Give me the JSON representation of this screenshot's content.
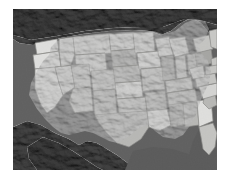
{
  "figure": {
    "kind": "map-image",
    "title": "Shaded relief map of the contiguous United States with state boundaries",
    "projection_look": "equirectangular-ish continental view",
    "style": "grayscale shaded relief, states filled light gray, surrounding land and ocean dark gray"
  },
  "canvas": {
    "width": 230,
    "height": 176,
    "background_color": "#ffffff"
  },
  "map_frame": {
    "x": 13,
    "y": 9,
    "width": 204,
    "height": 161,
    "border": "none"
  },
  "palette": {
    "page_background": "#ffffff",
    "ocean": "#5d5d5d",
    "foreign_land_dark": "#4a4a4a",
    "foreign_land_darkest": "#3a3a3a",
    "great_lakes": "#545454",
    "state_fill_lightest": "#e8e8e6",
    "state_fill_light": "#dcdcda",
    "state_fill_mid": "#cbcbc8",
    "state_fill_midtone": "#bdbdba",
    "state_fill_dark": "#a9a9a6",
    "state_border": "#8b8b88",
    "relief_shadow": "#6f6f6c",
    "relief_highlight": "#f2f2f0"
  },
  "regions": [
    {
      "name": "pacific-ocean",
      "tone": "dark",
      "label": "Pacific Ocean"
    },
    {
      "name": "atlantic-ocean",
      "tone": "dark",
      "label": "Atlantic Ocean"
    },
    {
      "name": "gulf-of-mexico",
      "tone": "dark",
      "label": "Gulf of Mexico"
    },
    {
      "name": "canada",
      "tone": "darkest",
      "label": "Canada"
    },
    {
      "name": "mexico",
      "tone": "darkest",
      "label": "Mexico"
    },
    {
      "name": "great-lakes",
      "tone": "dark",
      "label": "Great Lakes"
    }
  ],
  "states": [
    {
      "code": "WA",
      "name": "Washington",
      "tone": "lightest"
    },
    {
      "code": "OR",
      "name": "Oregon",
      "tone": "lightest"
    },
    {
      "code": "ID",
      "name": "Idaho",
      "tone": "light"
    },
    {
      "code": "MT",
      "name": "Montana",
      "tone": "light"
    },
    {
      "code": "WY",
      "name": "Wyoming",
      "tone": "light"
    },
    {
      "code": "CA",
      "name": "California",
      "tone": "lightest"
    },
    {
      "code": "NV",
      "name": "Nevada",
      "tone": "light"
    },
    {
      "code": "UT",
      "name": "Utah",
      "tone": "mid"
    },
    {
      "code": "AZ",
      "name": "Arizona",
      "tone": "mid"
    },
    {
      "code": "CO",
      "name": "Colorado",
      "tone": "mid"
    },
    {
      "code": "NM",
      "name": "New Mexico",
      "tone": "midtone"
    },
    {
      "code": "ND",
      "name": "North Dakota",
      "tone": "light"
    },
    {
      "code": "SD",
      "name": "South Dakota",
      "tone": "dark"
    },
    {
      "code": "NE",
      "name": "Nebraska",
      "tone": "midtone"
    },
    {
      "code": "KS",
      "name": "Kansas",
      "tone": "lightest"
    },
    {
      "code": "OK",
      "name": "Oklahoma",
      "tone": "mid"
    },
    {
      "code": "TX",
      "name": "Texas",
      "tone": "midtone"
    },
    {
      "code": "MN",
      "name": "Minnesota",
      "tone": "light"
    },
    {
      "code": "IA",
      "name": "Iowa",
      "tone": "lightest"
    },
    {
      "code": "MO",
      "name": "Missouri",
      "tone": "mid"
    },
    {
      "code": "AR",
      "name": "Arkansas",
      "tone": "midtone"
    },
    {
      "code": "LA",
      "name": "Louisiana",
      "tone": "lightest"
    },
    {
      "code": "WI",
      "name": "Wisconsin",
      "tone": "light"
    },
    {
      "code": "IL",
      "name": "Illinois",
      "tone": "dark"
    },
    {
      "code": "MI",
      "name": "Michigan",
      "tone": "light"
    },
    {
      "code": "IN",
      "name": "Indiana",
      "tone": "mid"
    },
    {
      "code": "OH",
      "name": "Ohio",
      "tone": "midtone"
    },
    {
      "code": "KY",
      "name": "Kentucky",
      "tone": "mid"
    },
    {
      "code": "TN",
      "name": "Tennessee",
      "tone": "midtone"
    },
    {
      "code": "MS",
      "name": "Mississippi",
      "tone": "dark"
    },
    {
      "code": "AL",
      "name": "Alabama",
      "tone": "midtone"
    },
    {
      "code": "GA",
      "name": "Georgia",
      "tone": "lightest"
    },
    {
      "code": "FL",
      "name": "Florida",
      "tone": "mid"
    },
    {
      "code": "SC",
      "name": "South Carolina",
      "tone": "midtone"
    },
    {
      "code": "NC",
      "name": "North Carolina",
      "tone": "light"
    },
    {
      "code": "VA",
      "name": "Virginia",
      "tone": "mid"
    },
    {
      "code": "WV",
      "name": "West Virginia",
      "tone": "light"
    },
    {
      "code": "PA",
      "name": "Pennsylvania",
      "tone": "dark"
    },
    {
      "code": "NY",
      "name": "New York",
      "tone": "mid"
    },
    {
      "code": "ME",
      "name": "Maine",
      "tone": "light"
    },
    {
      "code": "VT",
      "name": "Vermont",
      "tone": "mid"
    },
    {
      "code": "NH",
      "name": "New Hampshire",
      "tone": "mid"
    },
    {
      "code": "MA",
      "name": "Massachusetts",
      "tone": "light"
    },
    {
      "code": "CT",
      "name": "Connecticut",
      "tone": "mid"
    },
    {
      "code": "RI",
      "name": "Rhode Island",
      "tone": "mid"
    },
    {
      "code": "NJ",
      "name": "New Jersey",
      "tone": "mid"
    },
    {
      "code": "DE",
      "name": "Delaware",
      "tone": "mid"
    },
    {
      "code": "MD",
      "name": "Maryland",
      "tone": "mid"
    }
  ]
}
